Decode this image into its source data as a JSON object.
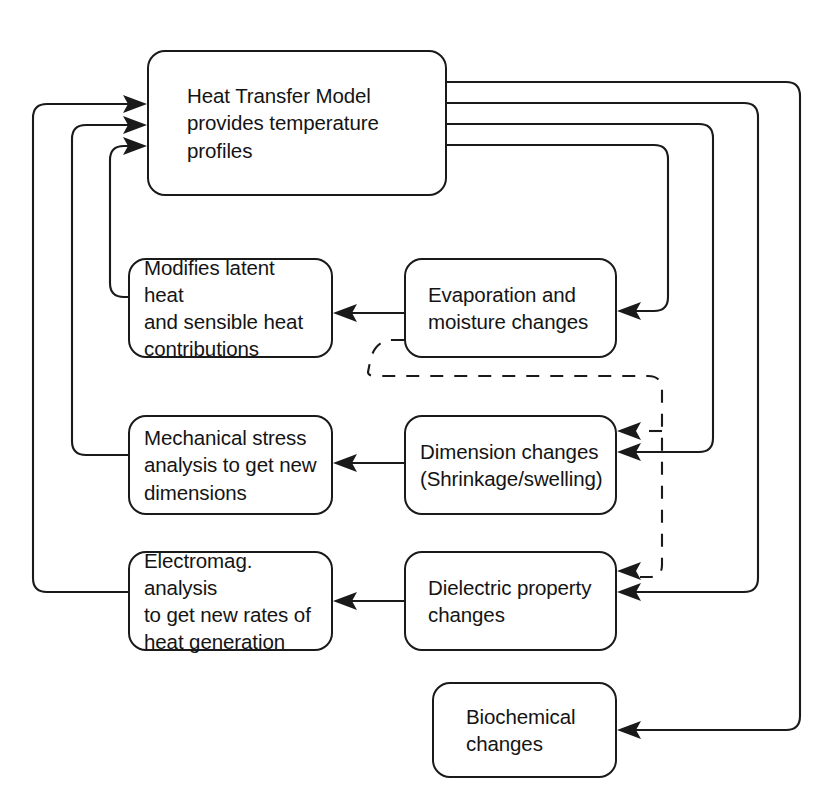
{
  "diagram": {
    "background_color": "#ffffff",
    "line_color": "#1a1a1a",
    "nodes": [
      {
        "id": "heat-transfer-model",
        "label": "Heat Transfer Model\nprovides temperature\nprofiles",
        "x": 147,
        "y": 50,
        "width": 300,
        "height": 146
      },
      {
        "id": "modifies-latent-heat",
        "label": "Modifies latent heat\nand sensible heat\ncontributions",
        "x": 128,
        "y": 258,
        "width": 205,
        "height": 100
      },
      {
        "id": "evaporation-moisture",
        "label": "Evaporation and\nmoisture changes",
        "x": 404,
        "y": 258,
        "width": 213,
        "height": 100
      },
      {
        "id": "mechanical-stress",
        "label": "Mechanical stress\nanalysis to get new\ndimensions",
        "x": 128,
        "y": 415,
        "width": 205,
        "height": 100
      },
      {
        "id": "dimension-changes",
        "label": "Dimension changes\n(Shrinkage/swelling)",
        "x": 404,
        "y": 415,
        "width": 213,
        "height": 100
      },
      {
        "id": "electromagnetic-analysis",
        "label": "Electromag. analysis\nto get new rates of\nheat generation",
        "x": 128,
        "y": 551,
        "width": 205,
        "height": 100
      },
      {
        "id": "dielectric-property",
        "label": "Dielectric property\nchanges",
        "x": 404,
        "y": 551,
        "width": 213,
        "height": 100
      },
      {
        "id": "biochemical-changes",
        "label": "Biochemical\nchanges",
        "x": 432,
        "y": 682,
        "width": 185,
        "height": 96
      }
    ],
    "edges": [
      {
        "id": "htm-to-evaporation",
        "from": "heat-transfer-model",
        "to": "evaporation-moisture",
        "style": "solid",
        "arrow": true
      },
      {
        "id": "htm-to-dimension",
        "from": "heat-transfer-model",
        "to": "dimension-changes",
        "style": "solid",
        "arrow": true
      },
      {
        "id": "htm-to-dielectric",
        "from": "heat-transfer-model",
        "to": "dielectric-property",
        "style": "solid",
        "arrow": true
      },
      {
        "id": "htm-to-biochemical",
        "from": "heat-transfer-model",
        "to": "biochemical-changes",
        "style": "solid",
        "arrow": true
      },
      {
        "id": "evaporation-to-modifies",
        "from": "evaporation-moisture",
        "to": "modifies-latent-heat",
        "style": "solid",
        "arrow": true
      },
      {
        "id": "dimension-to-mechanical",
        "from": "dimension-changes",
        "to": "mechanical-stress",
        "style": "solid",
        "arrow": true
      },
      {
        "id": "dielectric-to-electromagnetic",
        "from": "dielectric-property",
        "to": "electromagnetic-analysis",
        "style": "solid",
        "arrow": true
      },
      {
        "id": "modifies-to-htm",
        "from": "modifies-latent-heat",
        "to": "heat-transfer-model",
        "style": "solid",
        "arrow": true
      },
      {
        "id": "mechanical-to-htm",
        "from": "mechanical-stress",
        "to": "heat-transfer-model",
        "style": "solid",
        "arrow": true
      },
      {
        "id": "electromagnetic-to-htm",
        "from": "electromagnetic-analysis",
        "to": "heat-transfer-model",
        "style": "solid",
        "arrow": true
      },
      {
        "id": "evaporation-to-dimension-dashed",
        "from": "evaporation-moisture",
        "to": "dimension-changes",
        "style": "dashed",
        "arrow": true
      },
      {
        "id": "evaporation-to-dielectric-dashed",
        "from": "evaporation-moisture",
        "to": "dielectric-property",
        "style": "dashed",
        "arrow": true
      }
    ]
  }
}
